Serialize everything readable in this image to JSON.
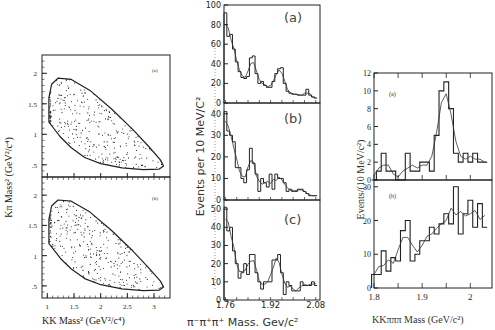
{
  "figure": {
    "left_panel": {
      "ylabel": "Kπ Mass² (GeV²/c⁴)",
      "xlabel": "KK Mass² (GeV²/c⁴)",
      "xticks": [
        "1",
        "1.5",
        "2",
        "2.5",
        "3"
      ],
      "yticks_top": [
        ".5",
        "1",
        "1.5",
        "2"
      ],
      "yticks_bottom": [
        ".5",
        "1",
        "1.5",
        "2"
      ],
      "subplot_labels": [
        "(a)",
        "(b)"
      ]
    },
    "middle_panel": {
      "ylabel": "Events per 10 MeV/C²",
      "xlabel": "π⁻π⁺π⁺ Mass. Gev/c²",
      "xticks": [
        "1.76",
        "1.92",
        "2.08"
      ],
      "a": {
        "label": "(a)",
        "yticks": [
          "0",
          "20",
          "40",
          "60",
          "80",
          "100"
        ]
      },
      "b": {
        "label": "(b)",
        "yticks": [
          "0",
          "10",
          "20",
          "30",
          "40"
        ]
      },
      "c": {
        "label": "(c)",
        "yticks": [
          "0",
          "10",
          "20",
          "30",
          "40",
          "50"
        ]
      }
    },
    "right_panel": {
      "ylabel": "Events/(10 MeV/c²)",
      "xlabel": "KKπππ Mass (GeV/c²)",
      "xticks": [
        "1.8",
        "1.9",
        "2"
      ],
      "a": {
        "label": "(a)",
        "yticks": [
          "0",
          "2",
          "4",
          "6",
          "8",
          "10",
          "12"
        ]
      },
      "b": {
        "label": "(b)",
        "yticks": [
          "0",
          "10",
          "20",
          "30"
        ]
      }
    }
  },
  "chart_data": [
    {
      "type": "scatter",
      "title": "Dalitz plot (a)",
      "xlabel": "KK Mass² (GeV²/c⁴)",
      "ylabel": "Kπ Mass² (GeV²/c⁴)",
      "xlim": [
        0.9,
        3.3
      ],
      "ylim": [
        0.3,
        2.3
      ],
      "note": "Points within kinematic boundary, clustering near KK≈1.04 (φ band) and along lower boundary"
    },
    {
      "type": "scatter",
      "title": "Dalitz plot (b)",
      "xlabel": "KK Mass² (GeV²/c⁴)",
      "ylabel": "Kπ Mass² (GeV²/c⁴)",
      "xlim": [
        0.9,
        3.3
      ],
      "ylim": [
        0.3,
        2.3
      ]
    },
    {
      "type": "bar",
      "title": "(a)",
      "xlabel": "π⁻π⁺π⁺ Mass. Gev/c²",
      "ylabel": "Events per 10 MeV/C²",
      "x": [
        1.76,
        1.77,
        1.78,
        1.79,
        1.8,
        1.81,
        1.82,
        1.83,
        1.84,
        1.85,
        1.86,
        1.87,
        1.88,
        1.89,
        1.9,
        1.91,
        1.92,
        1.93,
        1.94,
        1.95,
        1.96,
        1.97,
        1.98,
        1.99,
        2.0,
        2.01,
        2.02,
        2.03,
        2.04,
        2.05,
        2.06,
        2.07,
        2.08
      ],
      "values": [
        92,
        68,
        70,
        55,
        42,
        32,
        26,
        25,
        27,
        46,
        48,
        30,
        20,
        22,
        18,
        16,
        16,
        22,
        30,
        35,
        36,
        20,
        12,
        10,
        9,
        9,
        8,
        8,
        8,
        14,
        8,
        6,
        5
      ],
      "ylim": [
        0,
        100
      ]
    },
    {
      "type": "bar",
      "title": "(b)",
      "xlabel": "π⁻π⁺π⁺ Mass. Gev/c²",
      "ylabel": "Events per 10 MeV/C²",
      "x": [
        1.76,
        1.77,
        1.78,
        1.79,
        1.8,
        1.81,
        1.82,
        1.83,
        1.84,
        1.85,
        1.86,
        1.87,
        1.88,
        1.89,
        1.9,
        1.91,
        1.92,
        1.93,
        1.94,
        1.95,
        1.96,
        1.97,
        1.98,
        1.99,
        2.0,
        2.01,
        2.02,
        2.03,
        2.04,
        2.05,
        2.06,
        2.07,
        2.08
      ],
      "values": [
        41,
        32,
        30,
        27,
        15,
        15,
        10,
        8,
        14,
        24,
        17,
        12,
        4,
        10,
        8,
        6,
        12,
        5,
        12,
        10,
        10,
        8,
        4,
        5,
        4,
        4,
        5,
        5,
        4,
        3,
        2,
        2,
        2
      ],
      "ylim": [
        0,
        45
      ]
    },
    {
      "type": "bar",
      "title": "(c)",
      "xlabel": "π⁻π⁺π⁺ Mass. Gev/c²",
      "ylabel": "Events per 10 MeV/C²",
      "x": [
        1.76,
        1.77,
        1.78,
        1.79,
        1.8,
        1.81,
        1.82,
        1.83,
        1.84,
        1.85,
        1.86,
        1.87,
        1.88,
        1.89,
        1.9,
        1.91,
        1.92,
        1.93,
        1.94,
        1.95,
        1.96,
        1.97,
        1.98,
        1.99,
        2.0,
        2.01,
        2.02,
        2.03,
        2.04,
        2.05,
        2.06,
        2.07,
        2.08
      ],
      "values": [
        51,
        38,
        40,
        27,
        20,
        12,
        15,
        20,
        14,
        25,
        25,
        15,
        10,
        6,
        10,
        10,
        10,
        22,
        22,
        25,
        15,
        3,
        10,
        8,
        5,
        5,
        5,
        10,
        8,
        8,
        8,
        10,
        8
      ],
      "ylim": [
        0,
        55
      ]
    },
    {
      "type": "bar",
      "title": "(a)",
      "xlabel": "KKπππ Mass (GeV/c²)",
      "ylabel": "Events/(10 MeV/c²)",
      "x": [
        1.8,
        1.81,
        1.82,
        1.83,
        1.84,
        1.85,
        1.86,
        1.87,
        1.88,
        1.89,
        1.9,
        1.91,
        1.92,
        1.93,
        1.94,
        1.95,
        1.96,
        1.97,
        1.98,
        1.99,
        2.0,
        2.01,
        2.02,
        2.03
      ],
      "values": [
        0,
        1,
        3,
        1,
        1,
        0,
        0,
        3,
        1,
        1,
        2,
        2,
        1,
        5,
        10,
        11,
        8,
        3,
        2,
        3,
        2,
        3,
        2,
        2
      ],
      "fit_peak": 1.97,
      "ylim": [
        0,
        12
      ]
    },
    {
      "type": "bar",
      "title": "(b)",
      "xlabel": "KKπππ Mass (GeV/c²)",
      "ylabel": "Events/(10 MeV/c²)",
      "x": [
        1.8,
        1.81,
        1.82,
        1.83,
        1.84,
        1.85,
        1.86,
        1.87,
        1.88,
        1.89,
        1.9,
        1.91,
        1.92,
        1.93,
        1.94,
        1.95,
        1.96,
        1.97,
        1.98,
        1.99,
        2.0,
        2.01,
        2.02,
        2.03
      ],
      "values": [
        4,
        4,
        11,
        5,
        9,
        8,
        17,
        20,
        8,
        10,
        14,
        14,
        18,
        16,
        19,
        22,
        19,
        30,
        16,
        22,
        26,
        18,
        25,
        18
      ],
      "ylim": [
        0,
        32
      ]
    }
  ]
}
